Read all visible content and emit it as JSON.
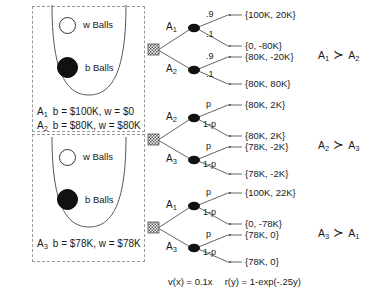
{
  "urn_panels": [
    {
      "name": "top",
      "white_ball_label": "w Balls",
      "black_ball_label": "b Balls",
      "acts": [
        {
          "tag": "A",
          "tag_sub": "1",
          "text": "b = $100K, w = $0"
        },
        {
          "tag": "A",
          "tag_sub": "2",
          "text": "b = $80K, w = $80K"
        }
      ]
    },
    {
      "name": "bottom",
      "white_ball_label": "w Balls",
      "black_ball_label": "b Balls",
      "acts": [
        {
          "tag": "A",
          "tag_sub": "3",
          "text": "b = $78K, w = $78K"
        }
      ]
    }
  ],
  "trees": [
    {
      "id": "tree-1",
      "branches": [
        {
          "act": "A",
          "act_sub": "1",
          "outcomes": [
            {
              "prob": ".9",
              "payoff": "{100K, 20K}"
            },
            {
              "prob": ".1",
              "payoff": "{0, -80K}"
            }
          ]
        },
        {
          "act": "A",
          "act_sub": "2",
          "outcomes": [
            {
              "prob": ".9",
              "payoff": "{80K, -20K}"
            },
            {
              "prob": ".1",
              "payoff": "{80K, 80K}"
            }
          ]
        }
      ],
      "preference": {
        "left": "A",
        "left_sub": "1",
        "rel": "≻",
        "right": "A",
        "right_sub": "2"
      }
    },
    {
      "id": "tree-2",
      "branches": [
        {
          "act": "A",
          "act_sub": "2",
          "outcomes": [
            {
              "prob": "p",
              "payoff": "{80K, 2K}"
            },
            {
              "prob": "1-p",
              "payoff": "{80K, 2K}"
            }
          ]
        },
        {
          "act": "A",
          "act_sub": "3",
          "outcomes": [
            {
              "prob": "p",
              "payoff": "{78K, -2K}"
            },
            {
              "prob": "1-p",
              "payoff": "{78K, -2K}"
            }
          ]
        }
      ],
      "preference": {
        "left": "A",
        "left_sub": "2",
        "rel": "≻",
        "right": "A",
        "right_sub": "3"
      }
    },
    {
      "id": "tree-3",
      "branches": [
        {
          "act": "A",
          "act_sub": "1",
          "outcomes": [
            {
              "prob": "p",
              "payoff": "{100K, 22K}"
            },
            {
              "prob": "1-p",
              "payoff": "{0, -78K}"
            }
          ]
        },
        {
          "act": "A",
          "act_sub": "3",
          "outcomes": [
            {
              "prob": "p",
              "payoff": "{78K, 0}"
            },
            {
              "prob": "1-p",
              "payoff": "{78K, 0}"
            }
          ]
        }
      ],
      "preference": {
        "left": "A",
        "left_sub": "3",
        "rel": "≻",
        "right": "A",
        "right_sub": "1"
      }
    }
  ],
  "formula": {
    "value_function": "v(x) = 0.1x",
    "risk_function": "r(y) = 1-exp(-.25y)"
  },
  "colors": {
    "ink": "#1a1a1a",
    "line": "#555555",
    "dashed_border": "#9a9a9a",
    "black_ball": "#111111",
    "white_ball": "#ffffff"
  }
}
